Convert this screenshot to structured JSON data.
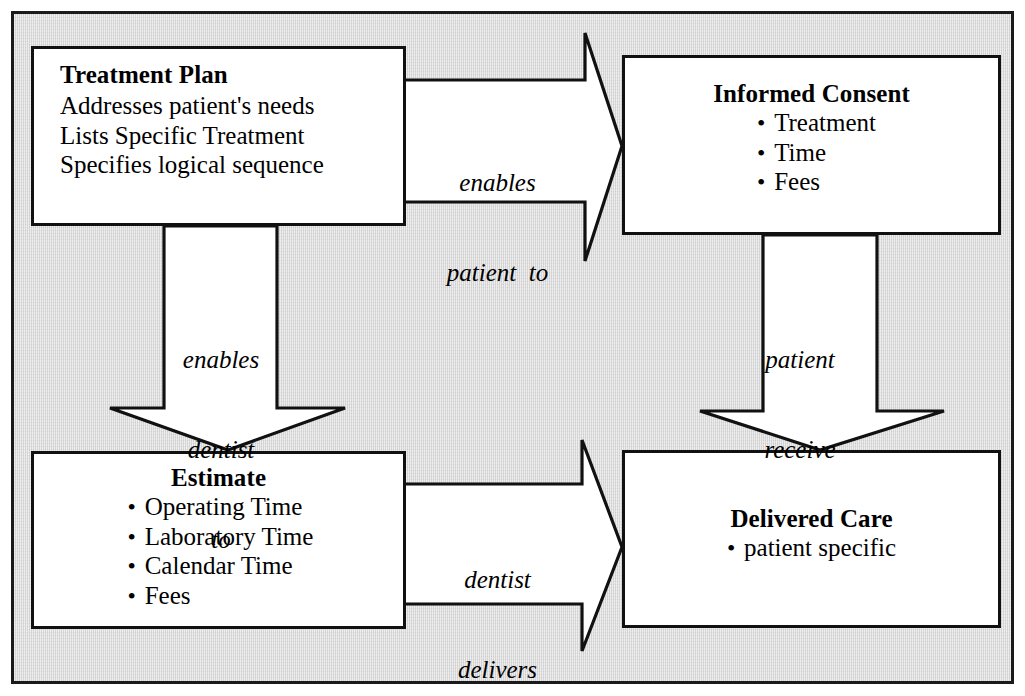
{
  "diagram": {
    "background_color": "#d8d8d8",
    "line_color": "#111111",
    "box_fill": "#ffffff",
    "nodes": {
      "treatment_plan": {
        "title": "Treatment Plan",
        "lines": [
          "Addresses patient's needs",
          "Lists Specific Treatment",
          "Specifies logical sequence"
        ]
      },
      "informed_consent": {
        "title": "Informed Consent",
        "bullets": [
          "Treatment",
          "Time",
          "Fees"
        ]
      },
      "estimate": {
        "title": "Estimate",
        "bullets": [
          "Operating Time",
          "Laboratory Time",
          "Calendar Time",
          "Fees"
        ]
      },
      "delivered_care": {
        "title": "Delivered Care",
        "bullets": [
          "patient specific"
        ]
      }
    },
    "arrows": {
      "plan_to_consent": {
        "label_lines": [
          "enables",
          "patient  to"
        ],
        "direction": "right",
        "from": "Treatment Plan",
        "to": "Informed Consent"
      },
      "plan_to_estimate": {
        "label_lines": [
          "enables",
          "dentist",
          "to"
        ],
        "direction": "down",
        "from": "Treatment Plan",
        "to": "Estimate"
      },
      "consent_to_care": {
        "label_lines": [
          "patient",
          "receive"
        ],
        "direction": "down",
        "from": "Informed Consent",
        "to": "Delivered Care"
      },
      "estimate_to_care": {
        "label_lines": [
          "dentist",
          "delivers"
        ],
        "direction": "right",
        "from": "Estimate",
        "to": "Delivered Care"
      }
    }
  }
}
